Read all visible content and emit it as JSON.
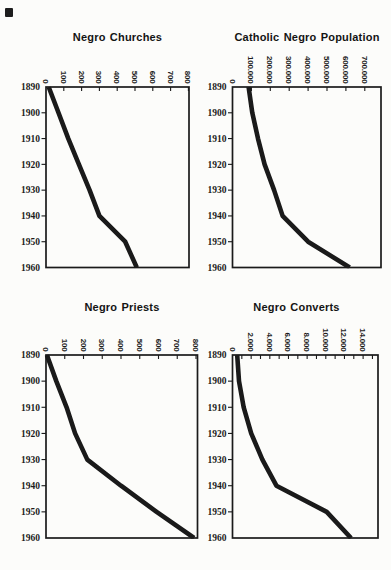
{
  "page": {
    "kind": "scanned statistics page with four charts",
    "ink_color": "#1a1a1a",
    "artifact": "small black ink mark at top-left corner"
  },
  "chart_data": [
    {
      "type": "line",
      "title": "Negro Churches",
      "orientation": "rotated: years run down the left axis, values increase along the top axis",
      "years": [
        1890,
        1900,
        1910,
        1920,
        1930,
        1940,
        1950,
        1960
      ],
      "values": [
        15,
        70,
        125,
        185,
        245,
        300,
        445,
        510
      ],
      "value_axis": {
        "min": 0,
        "max": 800,
        "label_values": [
          0,
          100,
          200,
          300,
          400,
          500,
          600,
          700,
          800
        ],
        "labels": [
          "0",
          "100",
          "200",
          "300",
          "400",
          "500",
          "600",
          "700",
          "800"
        ],
        "minor_tick_values": []
      },
      "line_color": "#1a1a1a",
      "grid": false,
      "legend": "none"
    },
    {
      "type": "line",
      "title": "Catholic Negro Population",
      "orientation": "rotated: years run down the left axis, values increase along the top axis",
      "years": [
        1890,
        1900,
        1910,
        1920,
        1930,
        1940,
        1950,
        1960
      ],
      "values": [
        85000,
        105000,
        135000,
        170000,
        220000,
        265000,
        400000,
        620000
      ],
      "value_axis": {
        "min": 0,
        "max": 700000,
        "label_values": [
          0,
          100000,
          200000,
          300000,
          400000,
          500000,
          600000,
          700000
        ],
        "labels": [
          "0",
          "100.000",
          "200.000",
          "300.000",
          "400.000",
          "500.000",
          "600.000",
          "700.000"
        ],
        "minor_tick_values": []
      },
      "line_color": "#1a1a1a",
      "grid": false,
      "legend": "none"
    },
    {
      "type": "line",
      "title": "Negro Priests",
      "orientation": "rotated: years run down the left axis, values increase along the top axis",
      "years": [
        1890,
        1900,
        1910,
        1920,
        1930,
        1940,
        1950,
        1960
      ],
      "values": [
        5,
        55,
        110,
        155,
        220,
        400,
        590,
        790
      ],
      "value_axis": {
        "min": 0,
        "max": 800,
        "label_values": [
          0,
          100,
          200,
          300,
          400,
          500,
          600,
          700,
          800
        ],
        "labels": [
          "0",
          "100",
          "200",
          "300",
          "400",
          "500",
          "600",
          "700",
          "800"
        ],
        "minor_tick_values": []
      },
      "line_color": "#1a1a1a",
      "grid": false,
      "legend": "none"
    },
    {
      "type": "line",
      "title": "Negro Converts",
      "orientation": "rotated: years run down the left axis, values increase along the top axis",
      "years": [
        1890,
        1900,
        1910,
        1920,
        1930,
        1940,
        1950,
        1960
      ],
      "values": [
        500,
        700,
        1200,
        2000,
        3200,
        4700,
        10100,
        12700
      ],
      "value_axis": {
        "min": 0,
        "max": 14000,
        "label_values": [
          0,
          2000,
          4000,
          6000,
          8000,
          10000,
          12000,
          14000
        ],
        "labels": [
          "0",
          "2.000",
          "4.000",
          "6.000",
          "8.000",
          "10.000",
          "12.000",
          "14.000"
        ],
        "minor_tick_values": [
          1000,
          2000,
          3000,
          4000,
          5000,
          6000,
          7000,
          8000,
          9000,
          10000,
          11000,
          12000,
          13000,
          14000,
          15000
        ]
      },
      "line_color": "#1a1a1a",
      "grid": false,
      "legend": "none"
    }
  ]
}
